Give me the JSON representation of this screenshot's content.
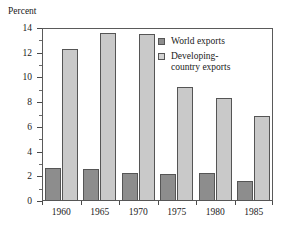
{
  "chart_data": {
    "type": "bar",
    "title": "",
    "xlabel": "",
    "ylabel": "Percent",
    "ylim": [
      0,
      14
    ],
    "y_ticks": [
      0,
      2,
      4,
      6,
      8,
      10,
      12,
      14
    ],
    "y_tick_labels": [
      "0",
      "2",
      "4",
      "6",
      "8",
      "10",
      "12",
      "14"
    ],
    "y_minor_ticks": [
      1,
      3,
      5,
      7,
      9,
      11,
      13
    ],
    "grid": false,
    "legend_position": "top-right",
    "categories": [
      "1960",
      "1965",
      "1970",
      "1975",
      "1980",
      "1985"
    ],
    "series": [
      {
        "name": "World exports",
        "color": "#8d8d8d",
        "values": [
          2.65,
          2.6,
          2.3,
          2.15,
          2.3,
          1.65
        ]
      },
      {
        "name": "Developing-country exports",
        "color": "#c9c9c9",
        "values": [
          12.3,
          13.6,
          13.55,
          9.2,
          8.35,
          6.85
        ]
      }
    ]
  },
  "legend": {
    "entries": [
      {
        "label": "World exports",
        "swatch": "dark-swatch-icon"
      },
      {
        "label": "Developing-country exports",
        "label_line1": "Developing-",
        "label_line2": "country exports",
        "swatch": "light-swatch-icon"
      }
    ]
  }
}
